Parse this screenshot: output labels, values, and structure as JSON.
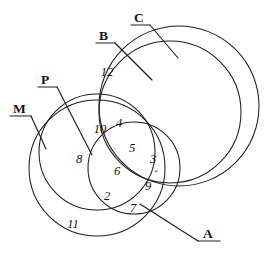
{
  "diagram": {
    "canvas": {
      "width": 264,
      "height": 262
    },
    "stroke_color": "#1d1d1d",
    "background_color": "#ffffff",
    "set_labels": [
      {
        "id": "C",
        "text": "C",
        "x": 134,
        "y": 22,
        "underline_from_x": 131,
        "underline_to_x": 150,
        "underline_y": 25
      },
      {
        "id": "B",
        "text": "B",
        "x": 99,
        "y": 40,
        "underline_from_x": 96,
        "underline_to_x": 115,
        "underline_y": 43
      },
      {
        "id": "P",
        "text": "P",
        "x": 41,
        "y": 84,
        "underline_from_x": 38,
        "underline_to_x": 57,
        "underline_y": 87
      },
      {
        "id": "M",
        "text": "M",
        "x": 13,
        "y": 113,
        "underline_from_x": 10,
        "underline_to_x": 31,
        "underline_y": 116
      },
      {
        "id": "A",
        "text": "A",
        "x": 203,
        "y": 238,
        "underline_from_x": 198,
        "underline_to_x": 218,
        "underline_y": 241
      }
    ],
    "region_numbers": [
      {
        "value": "12",
        "x": 107,
        "y": 76
      },
      {
        "value": "10",
        "x": 100,
        "y": 133
      },
      {
        "value": "4",
        "x": 119,
        "y": 127
      },
      {
        "value": "8",
        "x": 79,
        "y": 163
      },
      {
        "value": "5",
        "x": 132,
        "y": 152
      },
      {
        "value": "3",
        "x": 153,
        "y": 163
      },
      {
        "value": "6",
        "x": 117,
        "y": 175
      },
      {
        "value": "9",
        "x": 148,
        "y": 190
      },
      {
        "value": "2",
        "x": 107,
        "y": 200
      },
      {
        "value": "7",
        "x": 133,
        "y": 212
      },
      {
        "value": "11",
        "x": 73,
        "y": 228
      }
    ],
    "marks": [
      {
        "glyph": "*",
        "x": 156,
        "y": 174
      }
    ],
    "circles": [
      {
        "id": "C-outer",
        "label": "C",
        "cx": 179,
        "cy": 106,
        "r": 80
      },
      {
        "id": "B-inner",
        "label": "B",
        "cx": 170,
        "cy": 112,
        "r": 71
      },
      {
        "id": "M-outer",
        "label": "M",
        "cx": 97,
        "cy": 168,
        "r": 68
      },
      {
        "id": "P-inner",
        "label": "P",
        "cx": 97,
        "cy": 152,
        "r": 58
      },
      {
        "id": "A-circle",
        "label": "A",
        "cx": 134,
        "cy": 168,
        "r": 46
      }
    ]
  }
}
